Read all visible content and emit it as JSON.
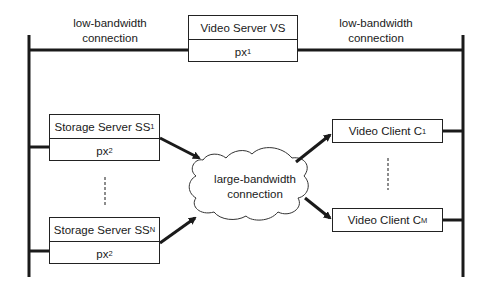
{
  "diagram": {
    "video_server": {
      "name": "Video Server VS",
      "param_base": "px",
      "param_sub": "1"
    },
    "storage_servers": [
      {
        "name_base": "Storage Server SS",
        "name_sub": "1",
        "param_base": "px",
        "param_sub": "2"
      },
      {
        "name_base": "Storage Server SS",
        "name_sub": "N",
        "param_base": "px",
        "param_sub": "2"
      }
    ],
    "video_clients": [
      {
        "name_base": "Video Client C",
        "name_sub": "1"
      },
      {
        "name_base": "Video Client C",
        "name_sub": "M"
      }
    ],
    "links": {
      "left_low": {
        "line1": "low-bandwidth",
        "line2": "connection"
      },
      "right_low": {
        "line1": "low-bandwidth",
        "line2": "connection"
      },
      "cloud": {
        "line1": "large-bandwidth",
        "line2": "connection"
      }
    },
    "colors": {
      "line": "#1a1a1a",
      "background": "#ffffff"
    }
  }
}
